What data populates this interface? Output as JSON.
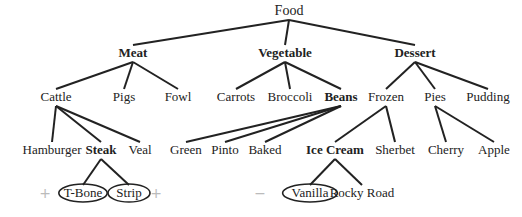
{
  "diagram": {
    "type": "tree",
    "root": "Food",
    "nodes": [
      {
        "id": "food",
        "label": "Food",
        "bold": false,
        "x": 289,
        "y": 11,
        "parent": null
      },
      {
        "id": "meat",
        "label": "Meat",
        "bold": true,
        "x": 133,
        "y": 53,
        "parent": "food"
      },
      {
        "id": "vegetable",
        "label": "Vegetable",
        "bold": true,
        "x": 285,
        "y": 53,
        "parent": "food"
      },
      {
        "id": "dessert",
        "label": "Dessert",
        "bold": true,
        "x": 415,
        "y": 53,
        "parent": "food"
      },
      {
        "id": "cattle",
        "label": "Cattle",
        "bold": false,
        "x": 56,
        "y": 97,
        "parent": "meat"
      },
      {
        "id": "pigs",
        "label": "Pigs",
        "bold": false,
        "x": 124,
        "y": 97,
        "parent": "meat"
      },
      {
        "id": "fowl",
        "label": "Fowl",
        "bold": false,
        "x": 178,
        "y": 97,
        "parent": "meat"
      },
      {
        "id": "carrots",
        "label": "Carrots",
        "bold": false,
        "x": 236,
        "y": 97,
        "parent": "vegetable"
      },
      {
        "id": "broccoli",
        "label": "Broccoli",
        "bold": false,
        "x": 290,
        "y": 97,
        "parent": "vegetable"
      },
      {
        "id": "beans",
        "label": "Beans",
        "bold": true,
        "x": 341,
        "y": 97,
        "parent": "vegetable"
      },
      {
        "id": "frozen",
        "label": "Frozen",
        "bold": false,
        "x": 386,
        "y": 97,
        "parent": "dessert"
      },
      {
        "id": "pies",
        "label": "Pies",
        "bold": false,
        "x": 435,
        "y": 97,
        "parent": "dessert"
      },
      {
        "id": "pudding",
        "label": "Pudding",
        "bold": false,
        "x": 488,
        "y": 97,
        "parent": "dessert"
      },
      {
        "id": "hamburger",
        "label": "Hamburger",
        "bold": false,
        "x": 52,
        "y": 150,
        "parent": "cattle"
      },
      {
        "id": "steak",
        "label": "Steak",
        "bold": true,
        "x": 101,
        "y": 150,
        "parent": "cattle"
      },
      {
        "id": "veal",
        "label": "Veal",
        "bold": false,
        "x": 140,
        "y": 150,
        "parent": "cattle"
      },
      {
        "id": "green",
        "label": "Green",
        "bold": false,
        "x": 186,
        "y": 150,
        "parent": "beans"
      },
      {
        "id": "pinto",
        "label": "Pinto",
        "bold": false,
        "x": 225,
        "y": 150,
        "parent": "beans"
      },
      {
        "id": "baked",
        "label": "Baked",
        "bold": false,
        "x": 265,
        "y": 150,
        "parent": "beans"
      },
      {
        "id": "icecream",
        "label": "Ice Cream",
        "bold": true,
        "x": 335,
        "y": 150,
        "parent": "frozen"
      },
      {
        "id": "sherbet",
        "label": "Sherbet",
        "bold": false,
        "x": 395,
        "y": 150,
        "parent": "frozen"
      },
      {
        "id": "cherry",
        "label": "Cherry",
        "bold": false,
        "x": 446,
        "y": 150,
        "parent": "pies"
      },
      {
        "id": "apple",
        "label": "Apple",
        "bold": false,
        "x": 494,
        "y": 150,
        "parent": "pies"
      },
      {
        "id": "tbone",
        "label": "T-Bone",
        "bold": false,
        "x": 83,
        "y": 193,
        "parent": "steak",
        "circled": true
      },
      {
        "id": "strip",
        "label": "Strip",
        "bold": false,
        "x": 129,
        "y": 193,
        "parent": "steak",
        "circled": true
      },
      {
        "id": "vanilla",
        "label": "Vanilla",
        "bold": false,
        "x": 310,
        "y": 193,
        "parent": "icecream",
        "circled": true
      },
      {
        "id": "rockyroad",
        "label": "Rocky Road",
        "bold": false,
        "x": 362,
        "y": 193,
        "parent": "icecream",
        "circled": false
      }
    ],
    "markers": [
      {
        "name": "plus-marker-left",
        "symbol": "+",
        "x": 45,
        "y": 193
      },
      {
        "name": "plus-marker-right",
        "symbol": "+",
        "x": 156,
        "y": 193
      },
      {
        "name": "minus-marker",
        "symbol": "−",
        "x": 260,
        "y": 193
      }
    ],
    "colors": {
      "edge": "#222222",
      "text": "#222222",
      "marker": "#bbbbbb"
    }
  }
}
